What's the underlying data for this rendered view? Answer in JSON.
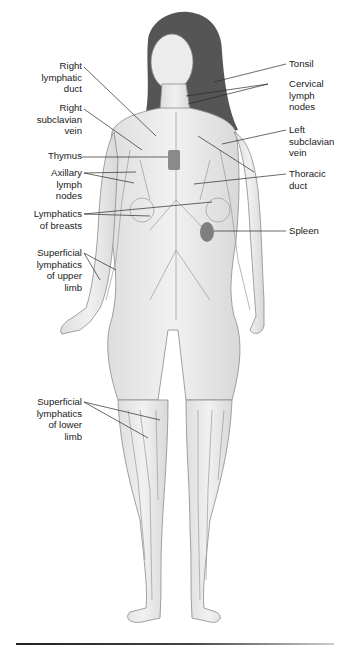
{
  "diagram": {
    "labels_left": [
      {
        "id": "right-lymphatic-duct",
        "text": "Right\nlymphatic\nduct",
        "lines": [
          "Right",
          "lymphatic",
          "duct"
        ]
      },
      {
        "id": "right-subclavian-vein",
        "text": "Right\nsubclavian\nvein",
        "lines": [
          "Right",
          "subclavian",
          "vein"
        ]
      },
      {
        "id": "thymus",
        "text": "Thymus",
        "lines": [
          "Thymus"
        ]
      },
      {
        "id": "axillary-lymph-nodes",
        "text": "Axillary\nlymph\nnodes",
        "lines": [
          "Axillary",
          "lymph",
          "nodes"
        ]
      },
      {
        "id": "lymphatics-of-breasts",
        "text": "Lymphatics\nof breasts",
        "lines": [
          "Lymphatics",
          "of breasts"
        ]
      },
      {
        "id": "superficial-lymphatics-upper-limb",
        "text": "Superficial\nlymphatics\nof upper\nlimb",
        "lines": [
          "Superficial",
          "lymphatics",
          "of upper",
          "limb"
        ]
      },
      {
        "id": "superficial-lymphatics-lower-limb",
        "text": "Superficial\nlymphatics\nof lower\nlimb",
        "lines": [
          "Superficial",
          "lymphatics",
          "of lower",
          "limb"
        ]
      }
    ],
    "labels_right": [
      {
        "id": "tonsil",
        "text": "Tonsil",
        "lines": [
          "Tonsil"
        ]
      },
      {
        "id": "cervical-lymph-nodes",
        "text": "Cervical\nlymph\nnodes",
        "lines": [
          "Cervical",
          "lymph",
          "nodes"
        ]
      },
      {
        "id": "left-subclavian-vein",
        "text": "Left\nsubclavian\nvein",
        "lines": [
          "Left",
          "subclavian",
          "vein"
        ]
      },
      {
        "id": "thoracic-duct",
        "text": "Thoracic\nduct",
        "lines": [
          "Thoracic",
          "duct"
        ]
      },
      {
        "id": "spleen",
        "text": "Spleen",
        "lines": [
          "Spleen"
        ]
      }
    ],
    "colors": {
      "background": "#ffffff",
      "skin": "#ebebeb",
      "outline": "#8a8a8a",
      "vessels": "#9a9a9a",
      "hair": "#4a4a4a",
      "organ": "#8c8c8c",
      "leader_lines": "#2a2a2a"
    }
  }
}
